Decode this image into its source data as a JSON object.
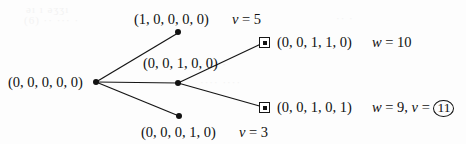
{
  "figure": {
    "type": "branch-and-bound-tree",
    "background_color": "#fdfdfd",
    "ink_color": "#101010"
  },
  "nodes": {
    "root": {
      "label": "(0, 0, 0, 0, 0)",
      "marker": "filled-dot",
      "x": 96,
      "y": 82
    },
    "child_top": {
      "label": "(1, 0, 0, 0, 0)",
      "marker": "filled-dot",
      "attr_label": "v = 5",
      "attr_symbol": "v",
      "attr_value": "5",
      "x": 178,
      "y": 32
    },
    "child_middle": {
      "label": "(0, 0, 1, 0, 0)",
      "marker": "filled-dot",
      "x": 178,
      "y": 83
    },
    "child_bottom": {
      "label": "(0, 0, 0, 1, 0)",
      "marker": "filled-dot",
      "attr_label": "v = 3",
      "attr_symbol": "v",
      "attr_value": "3",
      "x": 179,
      "y": 116
    },
    "leaf_top": {
      "label": "(0, 0, 1, 1, 0)",
      "marker": "square-with-dot",
      "attr_symbol": "w",
      "attr_value": "10",
      "x": 264,
      "y": 42
    },
    "leaf_bottom": {
      "label": "(0, 0, 1, 0, 1)",
      "marker": "square-with-dot",
      "attr_symbol_w": "w",
      "attr_value_w": "9",
      "attr_symbol_v": "v",
      "attr_value_v": "11",
      "attr_value_v_circled": true,
      "x": 264,
      "y": 107
    }
  },
  "edges": [
    {
      "from": "root",
      "to": "child_top"
    },
    {
      "from": "root",
      "to": "child_middle"
    },
    {
      "from": "root",
      "to": "child_bottom"
    },
    {
      "from": "child_middle",
      "to": "leaf_top"
    },
    {
      "from": "child_middle",
      "to": "leaf_bottom"
    }
  ],
  "text": {
    "root_label": "(0, 0, 0, 0, 0)",
    "top_label": "(1, 0, 0, 0, 0)",
    "top_attr_var": "v",
    "top_attr_eq": "= 5",
    "middle_label": "(0, 0, 1, 0, 0)",
    "bottom_label": "(0, 0, 0, 1, 0)",
    "bottom_attr_var": "v",
    "bottom_attr_eq": "= 3",
    "leaf_top_label": "(0, 0, 1, 1, 0)",
    "leaf_top_attr_var": "w",
    "leaf_top_attr_eq": "= 10",
    "leaf_bottom_label": "(0, 0, 1, 0, 1)",
    "leaf_bottom_attr_var_w": "w",
    "leaf_bottom_attr_eq_w": "= 9,",
    "leaf_bottom_attr_var_v": "v",
    "leaf_bottom_attr_eq_v": "=",
    "leaf_bottom_attr_value_v": "11"
  },
  "bleed_artifacts": [
    {
      "text": "əı ı əʒʒı",
      "x": 26,
      "y": 3
    },
    {
      "text": "(6) ·· ··· ·",
      "x": 24,
      "y": 14
    },
    {
      "text": "·· · ··",
      "x": 196,
      "y": 58
    },
    {
      "text": "···· ····",
      "x": 200,
      "y": 76
    },
    {
      "text": "·· ·",
      "x": 336,
      "y": 12
    }
  ]
}
